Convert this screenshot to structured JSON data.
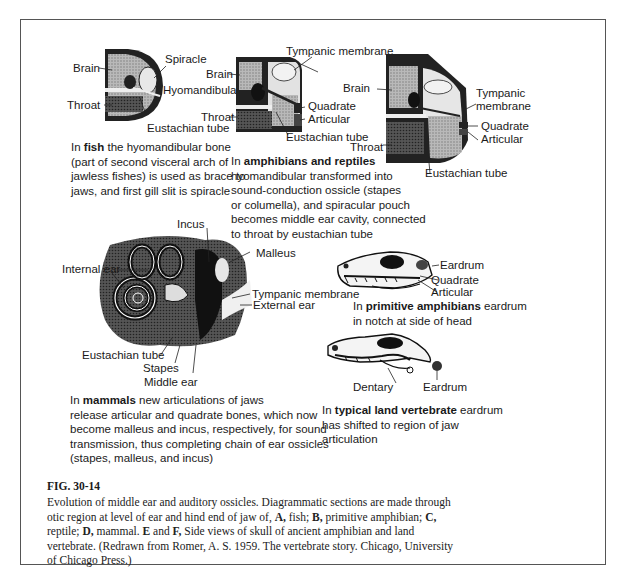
{
  "figure": {
    "number": "FIG. 30-14",
    "caption_lines": [
      "Evolution of middle ear and auditory ossicles. Diagrammatic sections are made through",
      "otic region at level of ear and hind end of jaw of, A, fish; B, primitive amphibian; C,",
      "reptile; D, mammal. E and F, Side views of skull of ancient amphibian and land",
      "vertebrate. (Redrawn from Romer, A. S. 1959. The vertebrate story. Chicago, University",
      "of Chicago Press.)"
    ],
    "caption_segments": {
      "l2_pre": "otic region at level of ear and hind end of jaw of, ",
      "A": "A,",
      "l2_mid1": " fish; ",
      "B": "B,",
      "l2_mid2": " primitive amphibian; ",
      "C": "C,",
      "l3_pre": "reptile; ",
      "D": "D,",
      "l3_mid": " mammal. ",
      "E": "E",
      "l3_and": " and ",
      "F": "F,",
      "l3_post": " Side views of skull of ancient amphibian and land"
    }
  },
  "panels": {
    "fish": {
      "labels": {
        "brain": "Brain",
        "spiracle": "Spiracle",
        "hyomandibular": "Hyomandibular",
        "throat": "Throat",
        "eustachian": "Eustachian tube"
      },
      "caption": {
        "pre": "In ",
        "bold": "fish",
        "l1_post": " the hyomandibular bone",
        "l2": "(part of second visceral arch of",
        "l3": "jawless fishes) is used as brace to",
        "l4": "jaws, and first gill slit is spiracle"
      }
    },
    "amphibian": {
      "labels": {
        "tympanic": "Tympanic membrane",
        "brain": "Brain",
        "throat": "Throat",
        "quadrate": "Quadrate",
        "articular": "Articular",
        "eustachian": "Eustachian tube"
      },
      "caption": {
        "pre": "In ",
        "bold": "amphibians and reptiles",
        "l2": "hyomandibular transformed into",
        "l3": "sound-conduction ossicle (stapes",
        "l4": "or columella), and spiracular pouch",
        "l5": "becomes middle ear cavity, connected",
        "l6": "to throat by eustachian tube"
      }
    },
    "reptile": {
      "labels": {
        "brain": "Brain",
        "tympanic1": "Tympanic",
        "tympanic2": "membrane",
        "quadrate": "Quadrate",
        "articular": "Articular",
        "throat": "Throat",
        "eustachian": "Eustachian tube"
      }
    },
    "mammal": {
      "labels": {
        "incus": "Incus",
        "malleus": "Malleus",
        "internal_ear": "Internal ear",
        "tympanic": "Tympanic membrane",
        "external_ear": "External ear",
        "eustachian": "Eustachian tube",
        "stapes": "Stapes",
        "middle_ear": "Middle ear"
      },
      "caption": {
        "pre": "In ",
        "bold": "mammals",
        "l1_post": " new articulations of jaws",
        "l2": "release articular and quadrate bones, which now",
        "l3": "become malleus and incus, respectively, for sound",
        "l4": "transmission, thus completing chain of ear ossicles",
        "l5": "(stapes, malleus, and incus)"
      }
    },
    "primitive_amphibian_skull": {
      "labels": {
        "eardrum": "Eardrum",
        "quadrate": "Quadrate",
        "articular": "Articular"
      },
      "caption": {
        "pre": "In ",
        "bold": "primitive amphibians",
        "l1_post": " eardrum",
        "l2": "in notch at side of head"
      }
    },
    "land_vertebrate_skull": {
      "labels": {
        "dentary": "Dentary",
        "eardrum": "Eardrum"
      },
      "caption": {
        "pre": "In ",
        "bold": "typical land vertebrate",
        "l1_post": " eardrum",
        "l2": "has shifted to region of jaw",
        "l3": "articulation"
      }
    }
  }
}
